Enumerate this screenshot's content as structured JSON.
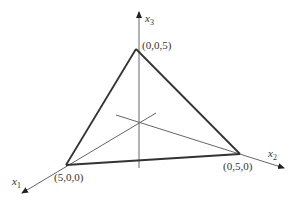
{
  "diagram": {
    "type": "simplex-3d",
    "axes": [
      {
        "name": "x1",
        "label": "x",
        "subscript": "1"
      },
      {
        "name": "x2",
        "label": "x",
        "subscript": "2"
      },
      {
        "name": "x3",
        "label": "x",
        "subscript": "3"
      }
    ],
    "vertices": [
      {
        "label": "(0,0,5)"
      },
      {
        "label": "(5,0,0)"
      },
      {
        "label": "(0,5,0)"
      }
    ],
    "colors": {
      "edge": "#333333",
      "axis": "#555555"
    }
  }
}
